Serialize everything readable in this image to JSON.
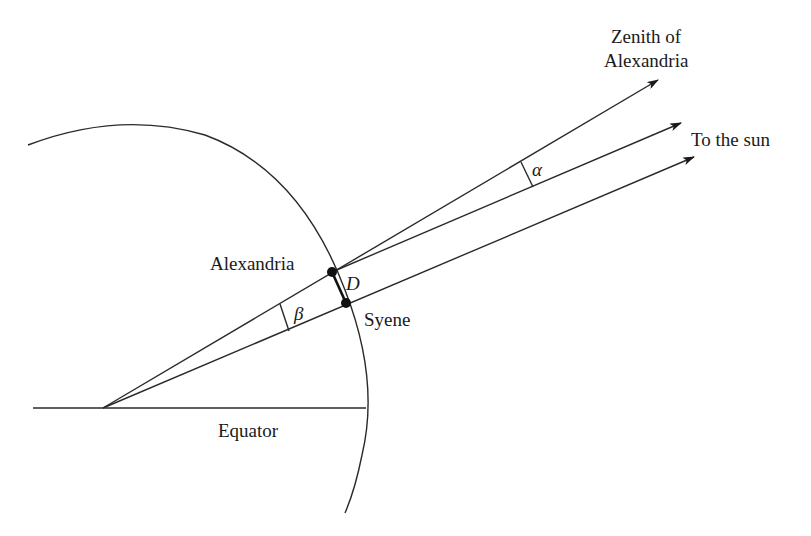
{
  "diagram": {
    "labels": {
      "zenith_line1": "Zenith of",
      "zenith_line2": "Alexandria",
      "sun": "To the sun",
      "alexandria": "Alexandria",
      "syene": "Syene",
      "distance": "D",
      "alpha": "α",
      "beta": "β",
      "equator": "Equator"
    },
    "colors": {
      "stroke": "#2a2a2a",
      "text": "#1a1a1a",
      "background": "#ffffff"
    }
  }
}
